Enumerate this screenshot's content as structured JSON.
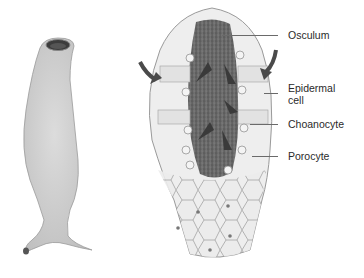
{
  "figure": {
    "left_illustration": "whole-sponge-exterior",
    "right_illustration": "sponge-cross-section",
    "labels": [
      {
        "id": "osculum",
        "text": "Osculum"
      },
      {
        "id": "epidermal",
        "text": "Epidermal",
        "text2": "cell"
      },
      {
        "id": "choanocyte",
        "text": "Choanocyte"
      },
      {
        "id": "porocyte",
        "text": "Porocyte"
      }
    ]
  },
  "colors": {
    "body_fill": "#d6d6d6",
    "body_stroke": "#9a9a9a",
    "cavity": "#6e6e6e",
    "arrow": "#4a4a4a",
    "leader_line": "#6a6a6a"
  }
}
